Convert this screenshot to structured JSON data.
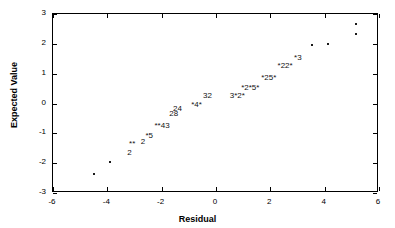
{
  "chart_data": {
    "type": "scatter",
    "title": "",
    "xlabel": "Residual",
    "ylabel": "Expected Value",
    "xlim": [
      -6,
      6
    ],
    "ylim": [
      -3,
      3
    ],
    "grid": false,
    "legend": "none",
    "xticks": [
      -6,
      -4,
      -2,
      0,
      2,
      4,
      6
    ],
    "xticklabels": [
      "-6",
      "-4",
      "-2",
      "0",
      "2",
      "4",
      "6"
    ],
    "yticks": [
      -3,
      -2,
      -1,
      0,
      1,
      2,
      3
    ],
    "yticklabels": [
      "-3",
      "-2",
      "-1",
      "0",
      "1",
      "2",
      "3"
    ],
    "note": "Normal probability plot; digits and asterisks denote overplotted point counts",
    "points": [
      {
        "label": "*",
        "x": -4.45,
        "y": -2.4
      },
      {
        "label": "*",
        "x": -3.85,
        "y": -2.0
      },
      {
        "label": "2",
        "x": -3.15,
        "y": -1.7
      },
      {
        "label": "**",
        "x": -3.05,
        "y": -1.4
      },
      {
        "label": "2",
        "x": -2.65,
        "y": -1.33
      },
      {
        "label": "*5",
        "x": -2.42,
        "y": -1.12
      },
      {
        "label": "**43",
        "x": -1.95,
        "y": -0.8
      },
      {
        "label": "28",
        "x": -1.52,
        "y": -0.4
      },
      {
        "label": "24",
        "x": -1.38,
        "y": -0.22
      },
      {
        "label": "*4*",
        "x": -0.68,
        "y": -0.1
      },
      {
        "label": "32",
        "x": -0.28,
        "y": 0.22
      },
      {
        "label": "3*2*",
        "x": 0.82,
        "y": 0.22
      },
      {
        "label": "*2*5*",
        "x": 1.3,
        "y": 0.48
      },
      {
        "label": "*25*",
        "x": 1.98,
        "y": 0.82
      },
      {
        "label": "*22*",
        "x": 2.58,
        "y": 1.22
      },
      {
        "label": "*3",
        "x": 3.05,
        "y": 1.48
      },
      {
        "label": "*",
        "x": 3.58,
        "y": 1.92
      },
      {
        "label": "*",
        "x": 4.15,
        "y": 1.95
      },
      {
        "label": "*",
        "x": 5.2,
        "y": 2.62
      },
      {
        "label": "*",
        "x": 5.18,
        "y": 2.28
      }
    ]
  }
}
